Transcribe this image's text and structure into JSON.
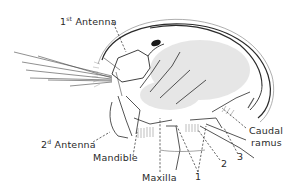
{
  "figure": {
    "labels": {
      "antenna1": {
        "ordinal": "1",
        "suffix": "st",
        "text": "Antenna"
      },
      "antenna2": {
        "ordinal": "2",
        "suffix": "d",
        "text": "Antenna"
      },
      "mandible": "Mandible",
      "maxilla": "Maxilla",
      "caudal_line1": "Caudal",
      "caudal_line2": "ramus",
      "limb1": "1",
      "limb2": "2",
      "limb3": "3"
    },
    "colors": {
      "ink": "#2a2a2a",
      "background": "#ffffff",
      "shading": "#9a9a9a"
    }
  }
}
